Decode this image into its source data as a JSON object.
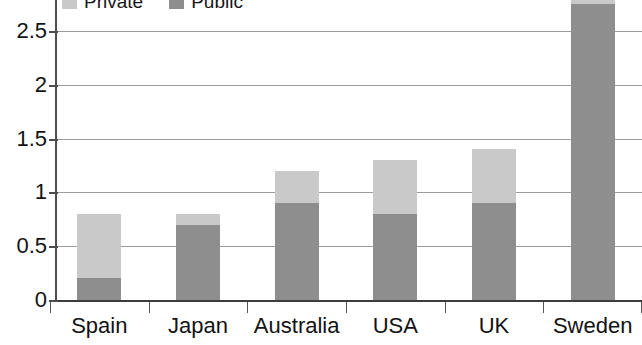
{
  "chart_data": {
    "type": "bar",
    "subtype": "stacked-vertical",
    "title": "",
    "subtitle": "",
    "xlabel": "",
    "ylabel": "",
    "categories": [
      "Spain",
      "Japan",
      "Australia",
      "USA",
      "UK",
      "Sweden"
    ],
    "series": [
      {
        "name": "Public",
        "color": "#8e8e8e",
        "values": [
          0.2,
          0.7,
          0.9,
          0.8,
          0.9,
          2.75
        ]
      },
      {
        "name": "Private",
        "color": "#c9c9c9",
        "values": [
          0.6,
          0.1,
          0.3,
          0.5,
          0.5,
          0.08
        ]
      }
    ],
    "totals": [
      0.8,
      0.8,
      1.2,
      1.3,
      1.4,
      2.83
    ],
    "yticks": [
      0,
      0.5,
      1,
      1.5,
      2,
      2.5
    ],
    "ytick_labels": [
      "0",
      "0.5",
      "1",
      "1.5",
      "2",
      "2.5"
    ],
    "ylim": [
      0,
      2.8
    ],
    "grid": true,
    "grid_axis": "y",
    "legend_position": "top",
    "legend_clipped_at_top": true
  },
  "legend": {
    "entries": [
      {
        "label": "Private",
        "color": "#c9c9c9"
      },
      {
        "label": "Public",
        "color": "#8e8e8e"
      }
    ]
  },
  "axes": {
    "y": {
      "ticks": [
        {
          "label": "2.5",
          "value": 2.5
        },
        {
          "label": "2",
          "value": 2.0
        },
        {
          "label": "1.5",
          "value": 1.5
        },
        {
          "label": "1",
          "value": 1.0
        },
        {
          "label": "0.5",
          "value": 0.5
        },
        {
          "label": "0",
          "value": 0.0
        }
      ]
    },
    "x": {
      "labels": [
        "Spain",
        "Japan",
        "Australia",
        "USA",
        "UK",
        "Sweden"
      ]
    }
  },
  "colors": {
    "private": "#c9c9c9",
    "public": "#8e8e8e",
    "gridline": "#9c9c9c",
    "axis": "#4d4d4d",
    "text": "#131313",
    "background": "#ffffff"
  }
}
